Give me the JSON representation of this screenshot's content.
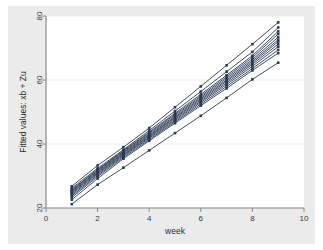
{
  "figure": {
    "background_color": "#ebebeb",
    "plot_background_color": "#ffffff",
    "outer_background_color": "#ffffff"
  },
  "chart_data": {
    "type": "line",
    "title": "",
    "subtitle": "",
    "xlabel": "week",
    "ylabel": "Fitted values: xb + Zu",
    "xlim": [
      0,
      10
    ],
    "ylim": [
      20,
      80
    ],
    "xticks": [
      0,
      2,
      4,
      6,
      8,
      10
    ],
    "xticklabels": [
      "0",
      "2",
      "4",
      "6",
      "8",
      "10"
    ],
    "yticks": [
      20,
      40,
      60,
      80
    ],
    "yticklabels": [
      "20",
      "40",
      "60",
      "80"
    ],
    "grid": "horizontal",
    "legend": "none",
    "marker": "square",
    "marker_size": 2.6,
    "line_color": "#2b3a55",
    "line_width": 0.9,
    "grid_color": "#e8e8e8",
    "axis_color": "#8a8a8a",
    "x": [
      1,
      2,
      3,
      4,
      5,
      6,
      7,
      8,
      9
    ],
    "series": [
      {
        "name": "id-1",
        "values": [
          26.8,
          33.3,
          39.0,
          45.0,
          51.5,
          58.0,
          64.6,
          71.2,
          78.0
        ]
      },
      {
        "name": "id-2",
        "values": [
          26.2,
          32.4,
          38.2,
          44.2,
          50.3,
          56.4,
          62.6,
          68.8,
          76.4
        ]
      },
      {
        "name": "id-3",
        "values": [
          25.8,
          32.0,
          37.9,
          43.7,
          49.6,
          55.5,
          61.5,
          67.6,
          75.2
        ]
      },
      {
        "name": "id-4",
        "values": [
          25.5,
          31.8,
          37.7,
          43.4,
          49.2,
          55.0,
          61.0,
          67.0,
          74.4
        ]
      },
      {
        "name": "id-5",
        "values": [
          25.2,
          31.5,
          37.4,
          43.0,
          48.8,
          54.6,
          60.5,
          66.4,
          73.4
        ]
      },
      {
        "name": "id-6",
        "values": [
          24.9,
          31.2,
          37.1,
          42.7,
          48.4,
          54.2,
          60.0,
          65.9,
          72.6
        ]
      },
      {
        "name": "id-7",
        "values": [
          24.6,
          30.9,
          36.8,
          42.4,
          48.1,
          53.8,
          59.6,
          65.4,
          72.0
        ]
      },
      {
        "name": "id-8",
        "values": [
          24.2,
          30.6,
          36.5,
          42.1,
          47.7,
          53.4,
          59.1,
          64.9,
          71.2
        ]
      },
      {
        "name": "id-9",
        "values": [
          23.8,
          30.2,
          36.2,
          41.8,
          47.3,
          53.0,
          58.6,
          64.3,
          70.4
        ]
      },
      {
        "name": "id-10",
        "values": [
          23.3,
          29.8,
          35.8,
          41.4,
          46.9,
          52.5,
          58.0,
          63.6,
          69.4
        ]
      },
      {
        "name": "id-11",
        "values": [
          22.6,
          29.2,
          35.4,
          41.0,
          46.5,
          52.0,
          57.4,
          63.0,
          68.4
        ]
      },
      {
        "name": "id-12",
        "values": [
          21.2,
          27.3,
          32.6,
          38.0,
          43.4,
          48.8,
          54.4,
          60.2,
          65.4
        ]
      }
    ]
  }
}
